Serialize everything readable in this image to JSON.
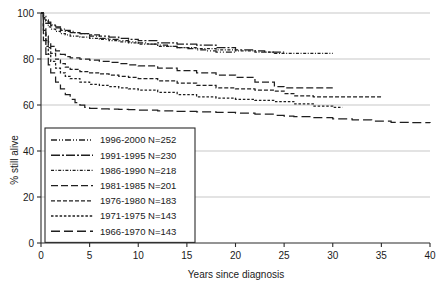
{
  "chart_data": {
    "type": "line",
    "title": "",
    "subtitle": "",
    "xlabel": "Years since diagnosis",
    "ylabel": "% still alive",
    "xlim": [
      0,
      40
    ],
    "ylim": [
      0,
      100
    ],
    "xticks": [
      0,
      5,
      10,
      15,
      20,
      25,
      30,
      35,
      40
    ],
    "xticklabels": [
      "0",
      "5",
      "10",
      "15",
      "20",
      "25",
      "30",
      "35",
      "40"
    ],
    "yticks": [
      0,
      20,
      40,
      60,
      80,
      100
    ],
    "yticklabels": [
      "0",
      "20",
      "40",
      "60",
      "80",
      "100"
    ],
    "grid": "horizontal",
    "legend_position": "lower-left-inside",
    "annotations": [],
    "series": [
      {
        "name": "1996-2000 N=252",
        "period": "1996-2000",
        "n": 252,
        "dash": "6,2,1,2,1,2",
        "x": [
          0,
          0.25,
          0.5,
          0.75,
          1,
          1.5,
          2,
          2.5,
          3,
          3.5,
          4,
          5,
          6,
          7,
          8,
          9,
          10,
          11,
          12,
          13,
          14,
          15,
          16,
          17,
          18,
          19,
          20
        ],
        "y": [
          100,
          98.5,
          97,
          96,
          95,
          94,
          93,
          92.5,
          92,
          91.5,
          91,
          90,
          89,
          88.5,
          88,
          87.5,
          87,
          86.5,
          86,
          85.5,
          85,
          84.5,
          84,
          83.5,
          83,
          83,
          83
        ]
      },
      {
        "name": "1991-1995 N=230",
        "period": "1991-1995",
        "n": 230,
        "dash": "9,2,2,2",
        "x": [
          0,
          0.25,
          0.5,
          0.75,
          1,
          1.5,
          2,
          2.5,
          3,
          4,
          5,
          6,
          7,
          8,
          9,
          10,
          12,
          14,
          16,
          18,
          20,
          22,
          23,
          24,
          25
        ],
        "y": [
          100,
          98,
          96.5,
          95.5,
          94.5,
          93.5,
          92.5,
          92,
          91.5,
          91,
          90.5,
          90,
          89.5,
          89,
          88.5,
          88,
          87,
          86.5,
          86,
          85,
          84,
          83.5,
          83,
          83,
          83
        ]
      },
      {
        "name": "1986-1990 N=218",
        "period": "1986-1990",
        "n": 218,
        "dash": "3,1.6,1,1.6",
        "x": [
          0,
          0.25,
          0.5,
          0.75,
          1,
          1.5,
          2,
          2.5,
          3,
          4,
          5,
          6,
          7,
          8,
          9,
          10,
          12,
          14,
          16,
          18,
          20,
          22,
          24,
          25,
          26,
          28,
          30
        ],
        "y": [
          100,
          97.5,
          95.5,
          94,
          93,
          92,
          91,
          90.5,
          90,
          89.5,
          89,
          88.5,
          88,
          87.5,
          87,
          86.5,
          85.5,
          85,
          84.5,
          84,
          83.5,
          83,
          82.5,
          82.5,
          82.5,
          82.5,
          82.5
        ]
      },
      {
        "name": "1981-1985 N=201",
        "period": "1981-1985",
        "n": 201,
        "dash": "7,3",
        "x": [
          0,
          0.25,
          0.5,
          0.75,
          1,
          1.5,
          2,
          2.5,
          3,
          4,
          5,
          6,
          7,
          8,
          9,
          10,
          12,
          14,
          16,
          18,
          20,
          22,
          24,
          25,
          26,
          28,
          30
        ],
        "y": [
          100,
          94,
          90,
          87.5,
          85.5,
          83.5,
          82,
          81,
          80.5,
          80,
          79.5,
          79,
          78.5,
          78,
          77.5,
          77,
          76,
          75,
          74,
          73,
          72,
          70,
          68,
          67.5,
          67.5,
          67.5,
          67.5
        ]
      },
      {
        "name": "1976-1980 N=183",
        "period": "1976-1980",
        "n": 183,
        "dash": "4,2",
        "x": [
          0,
          0.25,
          0.5,
          0.75,
          1,
          1.5,
          2,
          2.5,
          3,
          4,
          5,
          6,
          7,
          8,
          9,
          10,
          12,
          14,
          16,
          18,
          20,
          22,
          24,
          25,
          26,
          28,
          30,
          32,
          34,
          35
        ],
        "y": [
          100,
          92.5,
          88,
          85,
          82.5,
          80,
          78,
          76.5,
          75.5,
          74.5,
          74,
          73.5,
          73,
          72.5,
          72,
          71.5,
          70.5,
          69.5,
          68.5,
          67.5,
          67,
          66.5,
          66,
          65,
          64,
          63.5,
          63.5,
          63.5,
          63.5,
          63.5
        ]
      },
      {
        "name": "1971-1975 N=143",
        "period": "1971-1975",
        "n": 143,
        "dash": "2.5,1.8",
        "x": [
          0,
          0.25,
          0.5,
          0.75,
          1,
          1.5,
          2,
          2.5,
          3,
          4,
          5,
          6,
          7,
          8,
          9,
          10,
          12,
          14,
          16,
          18,
          20,
          22,
          24,
          26,
          28,
          30,
          31
        ],
        "y": [
          100,
          91,
          85.5,
          82,
          79,
          76,
          74,
          72.5,
          71.5,
          70,
          69,
          68.5,
          68,
          67.5,
          67,
          66.5,
          65.5,
          64.5,
          63.5,
          63,
          62.5,
          62,
          61.5,
          60.5,
          59.5,
          59,
          59
        ]
      },
      {
        "name": "1966-1970 N=143",
        "period": "1966-1970",
        "n": 143,
        "dash": "9,4",
        "x": [
          0,
          0.25,
          0.5,
          0.75,
          1,
          1.5,
          2,
          2.5,
          3,
          3.5,
          4,
          4.5,
          5,
          6,
          7,
          8,
          9,
          10,
          12,
          14,
          16,
          18,
          20,
          22,
          24,
          25,
          26,
          28,
          30,
          32,
          34,
          36,
          38,
          40
        ],
        "y": [
          100,
          88,
          82,
          77.5,
          74,
          70,
          67,
          64.5,
          62.5,
          61,
          60,
          59,
          58.5,
          58.3,
          58.2,
          58.1,
          58,
          57.8,
          57.5,
          57.2,
          57,
          56.8,
          56.5,
          56,
          55.5,
          55.2,
          55,
          54.5,
          54,
          53.5,
          53,
          52.5,
          52.3,
          52.2
        ]
      }
    ]
  },
  "colors": {
    "axis": "#2b2b2b",
    "grid": "#b9b9b9",
    "curve": "#1f1f1f",
    "background": "#ffffff"
  }
}
